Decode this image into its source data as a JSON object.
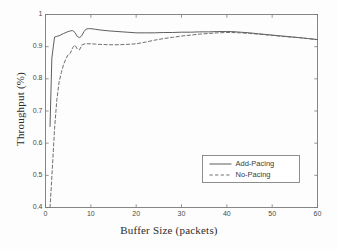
{
  "chart_data": {
    "type": "line",
    "title": "",
    "xlabel": "Buffer Size (packets)",
    "ylabel": "Throughput (%)",
    "xlim": [
      0,
      60
    ],
    "ylim": [
      0.4,
      1.0
    ],
    "xticks": [
      0,
      10,
      20,
      30,
      40,
      50,
      60
    ],
    "yticks": [
      0.4,
      0.5,
      0.6,
      0.7,
      0.8,
      0.9,
      1
    ],
    "ytick_labels": [
      "0.4",
      "0.5",
      "0.6",
      "0.7",
      "0.8",
      "0.9",
      "1"
    ],
    "xtick_labels": [
      "0",
      "10",
      "20",
      "30",
      "40",
      "50",
      "60"
    ],
    "grid": false,
    "legend_position": "lower right",
    "series": [
      {
        "name": "Add-Pacing",
        "style": "solid",
        "color": "#555555",
        "x": [
          1,
          1.4,
          2,
          2.5,
          3,
          4,
          5,
          5.5,
          6,
          6.5,
          7,
          7.5,
          8,
          8.5,
          9,
          9.5,
          10,
          11,
          12,
          14,
          16,
          18,
          20,
          22,
          24,
          26,
          28,
          30,
          32,
          34,
          36,
          38,
          40,
          41,
          43,
          45,
          47,
          50,
          53,
          56,
          58,
          60
        ],
        "y": [
          0.652,
          0.865,
          0.93,
          0.932,
          0.934,
          0.941,
          0.947,
          0.949,
          0.95,
          0.944,
          0.932,
          0.928,
          0.934,
          0.947,
          0.955,
          0.956,
          0.956,
          0.954,
          0.952,
          0.949,
          0.947,
          0.945,
          0.943,
          0.943,
          0.943,
          0.944,
          0.944,
          0.945,
          0.945,
          0.946,
          0.946,
          0.947,
          0.947,
          0.947,
          0.945,
          0.943,
          0.94,
          0.936,
          0.932,
          0.928,
          0.925,
          0.922
        ]
      },
      {
        "name": "No-Pacing",
        "style": "dashed",
        "color": "#666666",
        "x": [
          1,
          1.3,
          1.6,
          2,
          2.5,
          3,
          3.5,
          4,
          4.5,
          5,
          5.5,
          6,
          6.5,
          7,
          7.5,
          8,
          8.5,
          9,
          10,
          11,
          12,
          14,
          16,
          18,
          20,
          22,
          24,
          26,
          28,
          30,
          32,
          34,
          36,
          38,
          40,
          41,
          43,
          45,
          47,
          50,
          53,
          56,
          58,
          60
        ],
        "y": [
          0.4,
          0.47,
          0.545,
          0.645,
          0.735,
          0.79,
          0.82,
          0.845,
          0.862,
          0.875,
          0.88,
          0.897,
          0.905,
          0.893,
          0.89,
          0.905,
          0.908,
          0.909,
          0.909,
          0.908,
          0.907,
          0.906,
          0.906,
          0.907,
          0.909,
          0.914,
          0.92,
          0.925,
          0.929,
          0.933,
          0.936,
          0.939,
          0.941,
          0.943,
          0.944,
          0.944,
          0.943,
          0.941,
          0.939,
          0.935,
          0.931,
          0.928,
          0.925,
          0.922
        ]
      }
    ]
  },
  "legend": {
    "entries": [
      {
        "label": "Add-Pacing",
        "style": "solid"
      },
      {
        "label": "No-Pacing",
        "style": "dashed"
      }
    ]
  },
  "colors": {
    "axis": "#7a7a7a",
    "text": "#2b2b2b",
    "background": "#fdfdfd",
    "series_solid": "#555555",
    "series_dashed": "#666666"
  }
}
